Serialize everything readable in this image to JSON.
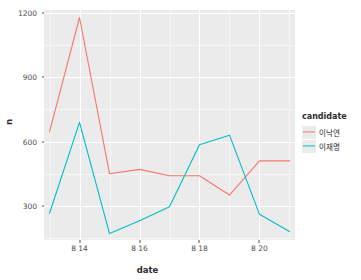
{
  "chart_data": {
    "type": "line",
    "title": "",
    "xlabel": "date",
    "ylabel": "n",
    "grid": true,
    "legend_position": "right",
    "legend_title": "candidate",
    "x": [
      "8 13",
      "8 14",
      "8 15",
      "8 16",
      "8 17",
      "8 18",
      "8 19",
      "8 20",
      "8 21"
    ],
    "x_tick_labels": [
      "8 14",
      "8 16",
      "8 18",
      "8 20"
    ],
    "x_tick_values": [
      "8 14",
      "8 16",
      "8 18",
      "8 20"
    ],
    "y_tick_labels": [
      "300",
      "600",
      "900",
      "1200"
    ],
    "y_tick_values": [
      300,
      600,
      900,
      1200
    ],
    "ylim": [
      140,
      1215
    ],
    "series": [
      {
        "name": "이낙연",
        "color": "#f8766d",
        "values": [
          645,
          1180,
          450,
          470,
          440,
          440,
          350,
          510,
          510
        ]
      },
      {
        "name": "이재명",
        "color": "#00bfc4",
        "values": [
          265,
          690,
          170,
          230,
          295,
          585,
          630,
          260,
          180
        ]
      }
    ]
  },
  "legend": {
    "title": "candidate",
    "items": [
      {
        "label": "이낙연",
        "color": "#f8766d"
      },
      {
        "label": "이재명",
        "color": "#00bfc4"
      }
    ]
  },
  "axes": {
    "x_title": "date",
    "y_title": "n"
  },
  "theme": {
    "panel_background": "#ebebeb",
    "grid_color": "#ffffff",
    "text_color": "#4d4d4d",
    "plot_background": "#ffffff"
  }
}
